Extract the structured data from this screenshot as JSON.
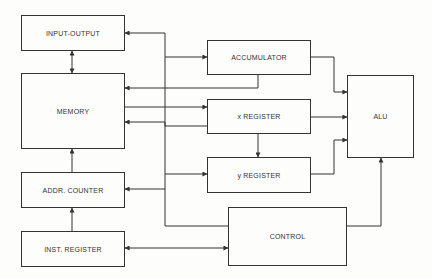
{
  "diagram": {
    "title": "",
    "colors": {
      "line": "#333333",
      "background": "#fdfdfb"
    },
    "blocks": [
      {
        "id": "io",
        "label": "INPUT-OUTPUT",
        "x": 21,
        "y": 15,
        "w": 104,
        "h": 36
      },
      {
        "id": "memory",
        "label": "MEMORY",
        "x": 21,
        "y": 73,
        "w": 104,
        "h": 76
      },
      {
        "id": "addr_counter",
        "label": "ADDR. COUNTER",
        "x": 21,
        "y": 172,
        "w": 104,
        "h": 36
      },
      {
        "id": "inst_register",
        "label": "INST. REGISTER",
        "x": 21,
        "y": 231,
        "w": 104,
        "h": 36
      },
      {
        "id": "accumulator",
        "label": "ACCUMULATOR",
        "x": 207,
        "y": 40,
        "w": 104,
        "h": 35
      },
      {
        "id": "x_register",
        "label": "x REGISTER",
        "x": 207,
        "y": 99,
        "w": 104,
        "h": 35
      },
      {
        "id": "y_register",
        "label": "y REGISTER",
        "x": 207,
        "y": 157,
        "w": 104,
        "h": 36
      },
      {
        "id": "control",
        "label": "CONTROL",
        "x": 228,
        "y": 207,
        "w": 119,
        "h": 59
      },
      {
        "id": "alu",
        "label": "ALU",
        "x": 347,
        "y": 75,
        "w": 67,
        "h": 83
      }
    ],
    "connections": [
      {
        "from": "bus",
        "to": "io",
        "points": [
          [
            165,
            33
          ],
          [
            125,
            33
          ]
        ],
        "arrow": "end"
      },
      {
        "from": "io",
        "to": "memory",
        "points": [
          [
            72,
            51
          ],
          [
            72,
            73
          ]
        ],
        "arrow": "both"
      },
      {
        "from": "bus",
        "to": "accumulator",
        "points": [
          [
            165,
            57
          ],
          [
            207,
            57
          ]
        ],
        "arrow": "end"
      },
      {
        "from": "accumulator",
        "to": "memory",
        "points": [
          [
            258,
            75
          ],
          [
            258,
            88
          ],
          [
            125,
            88
          ]
        ],
        "arrow": "end"
      },
      {
        "from": "memory",
        "to": "x_register",
        "points": [
          [
            125,
            107
          ],
          [
            207,
            107
          ]
        ],
        "arrow": "end"
      },
      {
        "from": "x_register",
        "to": "memory",
        "points": [
          [
            207,
            126
          ],
          [
            165,
            126
          ],
          [
            165,
            122
          ],
          [
            125,
            122
          ]
        ],
        "arrow": "end"
      },
      {
        "from": "x_register",
        "to": "y_register",
        "points": [
          [
            258,
            134
          ],
          [
            258,
            157
          ]
        ],
        "arrow": "end"
      },
      {
        "from": "bus",
        "to": "y_register",
        "points": [
          [
            165,
            174
          ],
          [
            207,
            174
          ]
        ],
        "arrow": "end"
      },
      {
        "from": "bus",
        "to": "addr_counter",
        "points": [
          [
            165,
            189
          ],
          [
            125,
            189
          ]
        ],
        "arrow": "end"
      },
      {
        "from": "addr_counter",
        "to": "memory",
        "points": [
          [
            72,
            172
          ],
          [
            72,
            149
          ]
        ],
        "arrow": "end"
      },
      {
        "from": "inst_register",
        "to": "addr_counter",
        "points": [
          [
            72,
            231
          ],
          [
            72,
            208
          ]
        ],
        "arrow": "end"
      },
      {
        "from": "bus",
        "to": "control",
        "points": [
          [
            165,
            226
          ],
          [
            228,
            226
          ]
        ],
        "arrow": "none"
      },
      {
        "from": "inst_register",
        "to": "control",
        "points": [
          [
            125,
            248
          ],
          [
            228,
            248
          ]
        ],
        "arrow": "both"
      },
      {
        "from": "accumulator",
        "to": "alu",
        "points": [
          [
            311,
            57
          ],
          [
            334,
            57
          ],
          [
            334,
            92
          ],
          [
            347,
            92
          ]
        ],
        "arrow": "end"
      },
      {
        "from": "x_register",
        "to": "alu",
        "points": [
          [
            311,
            117
          ],
          [
            347,
            117
          ]
        ],
        "arrow": "end"
      },
      {
        "from": "y_register",
        "to": "alu",
        "points": [
          [
            311,
            174
          ],
          [
            334,
            174
          ],
          [
            334,
            140
          ],
          [
            347,
            140
          ]
        ],
        "arrow": "end"
      },
      {
        "from": "control",
        "to": "alu",
        "points": [
          [
            347,
            226
          ],
          [
            381,
            226
          ],
          [
            381,
            158
          ]
        ],
        "arrow": "end"
      },
      {
        "from": "bus",
        "to": "bus",
        "points": [
          [
            165,
            33
          ],
          [
            165,
            226
          ]
        ],
        "arrow": "none"
      }
    ]
  }
}
